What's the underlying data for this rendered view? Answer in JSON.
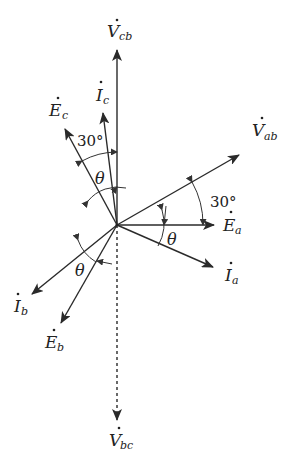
{
  "diagram": {
    "origin": {
      "x": 117,
      "y": 225
    },
    "colors": {
      "line": "#2a2a2a",
      "text": "#222222",
      "background": "#ffffff"
    },
    "phasors": [
      {
        "id": "Vcb",
        "symbol": "V",
        "subscript": "cb",
        "style": "solid",
        "end": {
          "x": 117,
          "y": 50
        }
      },
      {
        "id": "Ic",
        "symbol": "I",
        "subscript": "c",
        "style": "solid",
        "end": {
          "x": 103,
          "y": 113
        }
      },
      {
        "id": "Ec",
        "symbol": "E",
        "subscript": "c",
        "style": "solid",
        "end": {
          "x": 65,
          "y": 129
        }
      },
      {
        "id": "Vab",
        "symbol": "V",
        "subscript": "ab",
        "style": "solid",
        "end": {
          "x": 239,
          "y": 155
        }
      },
      {
        "id": "Ea",
        "symbol": "E",
        "subscript": "a",
        "style": "solid",
        "end": {
          "x": 214,
          "y": 225
        }
      },
      {
        "id": "Ia",
        "symbol": "I",
        "subscript": "a",
        "style": "solid",
        "end": {
          "x": 213,
          "y": 267
        }
      },
      {
        "id": "Ib",
        "symbol": "I",
        "subscript": "b",
        "style": "solid",
        "end": {
          "x": 32,
          "y": 294
        }
      },
      {
        "id": "Eb",
        "symbol": "E",
        "subscript": "b",
        "style": "solid",
        "end": {
          "x": 61,
          "y": 323
        }
      },
      {
        "id": "Vbc",
        "symbol": "V",
        "subscript": "bc",
        "style": "dashed",
        "end": {
          "x": 117,
          "y": 420
        }
      }
    ],
    "labels": {
      "Vcb": {
        "main": "V",
        "sub": "cb"
      },
      "Ic": {
        "main": "I",
        "sub": "c"
      },
      "Ec": {
        "main": "E",
        "sub": "c"
      },
      "Vab": {
        "main": "V",
        "sub": "ab"
      },
      "Ea": {
        "main": "E",
        "sub": "a"
      },
      "Ia": {
        "main": "I",
        "sub": "a"
      },
      "Ib": {
        "main": "I",
        "sub": "b"
      },
      "Eb": {
        "main": "E",
        "sub": "b"
      },
      "Vbc": {
        "main": "V",
        "sub": "bc"
      }
    },
    "angles": {
      "upper_30": "30°",
      "right_30": "30°",
      "upper_theta": "θ",
      "right_theta": "θ",
      "lower_theta": "θ"
    }
  }
}
